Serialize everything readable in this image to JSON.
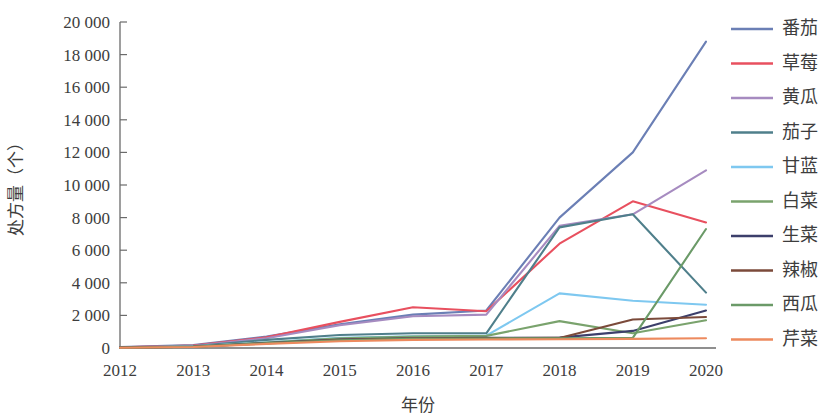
{
  "chart_data": {
    "type": "line",
    "title": "",
    "xlabel": "年份",
    "ylabel": "处方量（个）",
    "x": [
      2012,
      2013,
      2014,
      2015,
      2016,
      2017,
      2018,
      2019,
      2020
    ],
    "x_tick_labels": [
      "2012",
      "2013",
      "2014",
      "2015",
      "2016",
      "2017",
      "2018",
      "2019",
      "2020"
    ],
    "y_tick_labels": [
      "0",
      "2 000",
      "4 000",
      "6 000",
      "8 000",
      "10 000",
      "12 000",
      "14 000",
      "16 000",
      "18 000",
      "20 000"
    ],
    "y_tick_values": [
      0,
      2000,
      4000,
      6000,
      8000,
      10000,
      12000,
      14000,
      16000,
      18000,
      20000
    ],
    "ylim": [
      0,
      20000
    ],
    "xlim": [
      2012,
      2020
    ],
    "grid": false,
    "legend_position": "right",
    "series": [
      {
        "name": "番茄",
        "color": "#6b7fb5",
        "values": [
          60,
          180,
          700,
          1450,
          2050,
          2300,
          8000,
          12000,
          18800
        ]
      },
      {
        "name": "草莓",
        "color": "#e8505f",
        "values": [
          50,
          150,
          650,
          1600,
          2500,
          2250,
          6400,
          9000,
          7700
        ]
      },
      {
        "name": "黄瓜",
        "color": "#a68bc0",
        "values": [
          40,
          120,
          600,
          1400,
          1950,
          2050,
          7500,
          8200,
          10900
        ]
      },
      {
        "name": "茄子",
        "color": "#4f7f8b",
        "values": [
          40,
          110,
          500,
          800,
          900,
          900,
          7400,
          8200,
          3400
        ]
      },
      {
        "name": "甘蓝",
        "color": "#7ec8f0",
        "values": [
          30,
          90,
          350,
          620,
          720,
          760,
          3350,
          2900,
          2650
        ]
      },
      {
        "name": "白菜",
        "color": "#7aa36d",
        "values": [
          30,
          85,
          330,
          600,
          700,
          740,
          1650,
          900,
          1700
        ]
      },
      {
        "name": "生菜",
        "color": "#3c3f6b",
        "values": [
          25,
          80,
          300,
          520,
          600,
          620,
          640,
          1050,
          2300
        ]
      },
      {
        "name": "辣椒",
        "color": "#7b4a3a",
        "values": [
          25,
          75,
          290,
          500,
          580,
          600,
          620,
          1750,
          1900
        ]
      },
      {
        "name": "西瓜",
        "color": "#6b9a68",
        "values": [
          20,
          70,
          280,
          480,
          560,
          580,
          600,
          620,
          7300
        ]
      },
      {
        "name": "芹菜",
        "color": "#ed8a5e",
        "values": [
          20,
          60,
          250,
          420,
          500,
          520,
          540,
          560,
          600
        ]
      }
    ]
  },
  "legend": {
    "items": [
      {
        "label": "番茄"
      },
      {
        "label": "草莓"
      },
      {
        "label": "黄瓜"
      },
      {
        "label": "茄子"
      },
      {
        "label": "甘蓝"
      },
      {
        "label": "白菜"
      },
      {
        "label": "生菜"
      },
      {
        "label": "辣椒"
      },
      {
        "label": "西瓜"
      },
      {
        "label": "芹菜"
      }
    ]
  }
}
